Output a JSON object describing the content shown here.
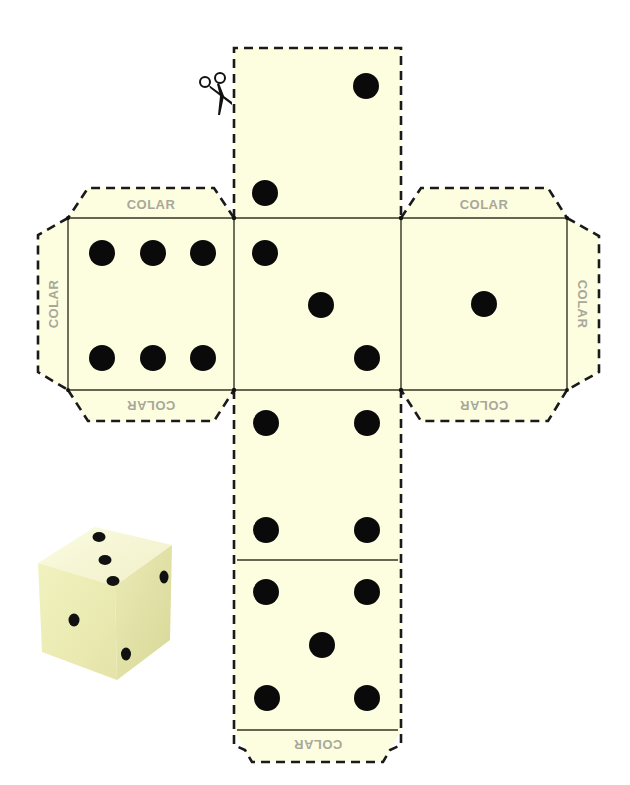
{
  "colors": {
    "paper": "#fdfde0",
    "cut_line": "#1a1a1a",
    "fold_line": "#333322",
    "pip": "#0a0a0a",
    "tab_label": "#a8a89a"
  },
  "tab_label": "COLAR",
  "tabs": [
    {
      "id": "tab-left-face-top",
      "label": "COLAR",
      "orientation": "normal"
    },
    {
      "id": "tab-left-face-left",
      "label": "COLAR",
      "orientation": "rotated-ccw"
    },
    {
      "id": "tab-left-face-bottom",
      "label": "COLAR",
      "orientation": "upside-down"
    },
    {
      "id": "tab-right-face-top",
      "label": "COLAR",
      "orientation": "normal"
    },
    {
      "id": "tab-right-face-right",
      "label": "COLAR",
      "orientation": "rotated-cw"
    },
    {
      "id": "tab-right-face-bottom",
      "label": "COLAR",
      "orientation": "upside-down"
    },
    {
      "id": "tab-bottom-face-bottom",
      "label": "COLAR",
      "orientation": "upside-down"
    }
  ],
  "faces": [
    {
      "id": "face-top",
      "value": 2
    },
    {
      "id": "face-left",
      "value": 6
    },
    {
      "id": "face-center",
      "value": 3
    },
    {
      "id": "face-right",
      "value": 1
    },
    {
      "id": "face-lower",
      "value": 4
    },
    {
      "id": "face-bottom",
      "value": 5
    }
  ],
  "icons": {
    "scissors": "scissors-icon"
  },
  "assembled_die": {
    "top_face_value": 3,
    "left_face_value": 1,
    "right_face_value": 2
  }
}
